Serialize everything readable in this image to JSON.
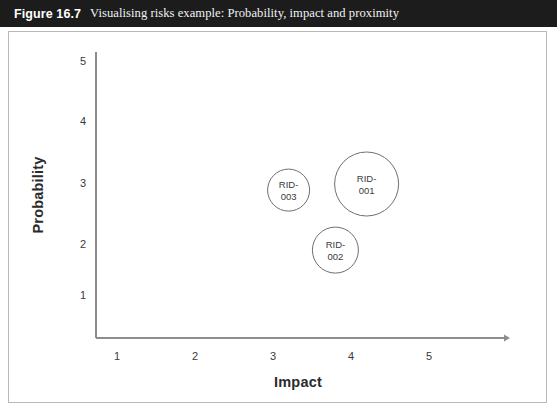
{
  "caption": {
    "figure_number": "Figure 16.7",
    "title": "Visualising risks example: Probability, impact and proximity"
  },
  "colors": {
    "caption_bar": "#1c1c1c",
    "caption_number_text": "#ffffff",
    "caption_title_text": "#f2f2f2",
    "plate_border": "#b9b9b9",
    "axis_line": "#8d8d8d",
    "bubble_stroke": "#6f6f6f",
    "bubble_fill": "#ffffff",
    "label_text": "#3a3a3a",
    "axis_title_text": "#2b2b2b",
    "background": "#ffffff"
  },
  "chart_data": {
    "type": "scatter",
    "title": "Visualising risks example: Probability, impact and proximity",
    "xlabel": "Impact",
    "ylabel": "Probability",
    "xlim": [
      0,
      5.6
    ],
    "ylim": [
      0,
      5.4
    ],
    "xticks": [
      1,
      2,
      3,
      4,
      5
    ],
    "yticks": [
      1,
      2,
      3,
      4,
      5
    ],
    "xtick_labels": [
      "1",
      "2",
      "3",
      "4",
      "5"
    ],
    "ytick_labels": [
      "1",
      "2",
      "3",
      "4",
      "5"
    ],
    "grid": false,
    "legend": false,
    "axis_arrows": [
      "x"
    ],
    "size_meaning": "proximity",
    "points": [
      {
        "label": "RID-001",
        "label_line1": "RID-",
        "label_line2": "001",
        "x": 4.2,
        "y": 3.0,
        "radius_px": 32
      },
      {
        "label": "RID-003",
        "label_line1": "RID-",
        "label_line2": "003",
        "x": 3.2,
        "y": 2.9,
        "radius_px": 21
      },
      {
        "label": "RID-002",
        "label_line1": "RID-",
        "label_line2": "002",
        "x": 3.8,
        "y": 1.9,
        "radius_px": 23
      }
    ]
  }
}
